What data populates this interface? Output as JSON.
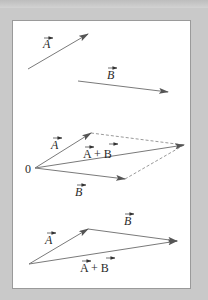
{
  "figure": {
    "panel_1": {
      "vector_a": {
        "label": "A",
        "from": [
          28,
          69
        ],
        "to": [
          88,
          34
        ],
        "label_pos": [
          43,
          48
        ]
      },
      "vector_b": {
        "label": "B",
        "from": [
          78,
          81
        ],
        "to": [
          168,
          92
        ],
        "label_pos": [
          107,
          79
        ]
      }
    },
    "panel_2": {
      "origin_label": "0",
      "origin": [
        35,
        168
      ],
      "vector_a": {
        "label": "A",
        "to": [
          91,
          133
        ],
        "label_pos": [
          51,
          149
        ]
      },
      "vector_b": {
        "label": "B",
        "to": [
          125,
          179
        ],
        "label_pos": [
          75,
          196
        ]
      },
      "vector_sum": {
        "label": "A + B",
        "to": [
          184,
          145
        ],
        "label_pos": [
          83,
          158
        ]
      }
    },
    "panel_3": {
      "origin": [
        29,
        264
      ],
      "vector_a": {
        "label": "A",
        "to": [
          88,
          229
        ],
        "label_pos": [
          45,
          244
        ]
      },
      "vector_b": {
        "label": "B",
        "from": [
          88,
          229
        ],
        "to": [
          177,
          241
        ],
        "label_pos": [
          124,
          225
        ]
      },
      "vector_sum": {
        "label": "A + B",
        "to": [
          177,
          241
        ],
        "label_pos": [
          80,
          272
        ]
      }
    },
    "colors": {
      "arrow": "#7a7a7a",
      "arrowhead": "#555555",
      "dashed": "#9a9a9a",
      "background": "#c9c9c9",
      "panel": "#ffffff"
    }
  }
}
